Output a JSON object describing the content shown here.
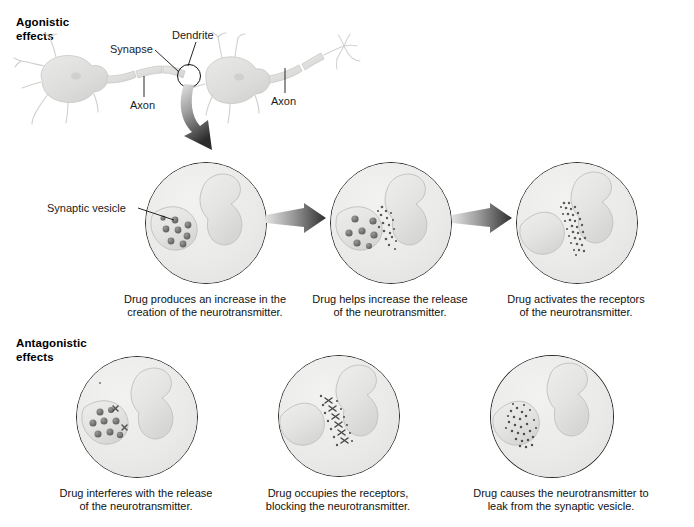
{
  "figure": {
    "title_cropped": "",
    "sections": [
      {
        "id": "agonistic",
        "label": "Agonistic\neffects"
      },
      {
        "id": "antagonistic",
        "label": "Antagonistic\neffects"
      }
    ]
  },
  "neuron_diagram": {
    "labels": {
      "dendrite": "Dendrite",
      "synapse": "Synapse",
      "axon_left": "Axon",
      "axon_right": "Axon"
    }
  },
  "annotations": {
    "synaptic_vesicle": "Synaptic vesicle"
  },
  "panels": {
    "agonistic": [
      {
        "id": "agonistic-1",
        "caption": "Drug produces an increase in the\ncreation of the neurotransmitter.",
        "state": "vesicles-in-terminal"
      },
      {
        "id": "agonistic-2",
        "caption": "Drug helps increase the release\nof the neurotransmitter.",
        "state": "vesicles-releasing"
      },
      {
        "id": "agonistic-3",
        "caption": "Drug activates the receptors\nof the neurotransmitter.",
        "state": "receptors-activated"
      }
    ],
    "antagonistic": [
      {
        "id": "antagonistic-1",
        "caption": "Drug interferes with the release\nof the neurotransmitter.",
        "state": "release-blocked"
      },
      {
        "id": "antagonistic-2",
        "caption": "Drug occupies the receptors,\nblocking the neurotransmitter.",
        "state": "receptors-occupied"
      },
      {
        "id": "antagonistic-3",
        "caption": "Drug causes the neurotransmitter to\nleak from the synaptic vesicle.",
        "state": "neurotransmitter-leaking"
      }
    ]
  },
  "colors": {
    "panel_fill": "#ececeb",
    "panel_stroke": "#2b2b2b",
    "cell_fill": "#e3e3e1",
    "cell_stroke": "#bcbcba",
    "vesicle_dark": "#6e6e6e",
    "vesicle_mid": "#8a8a8a",
    "particle": "#5a5a5a",
    "neuron_fill": "#dcdcda",
    "arrow_dark": "#3a3a3a",
    "arrow_light": "#dadada",
    "text": "#111111"
  }
}
